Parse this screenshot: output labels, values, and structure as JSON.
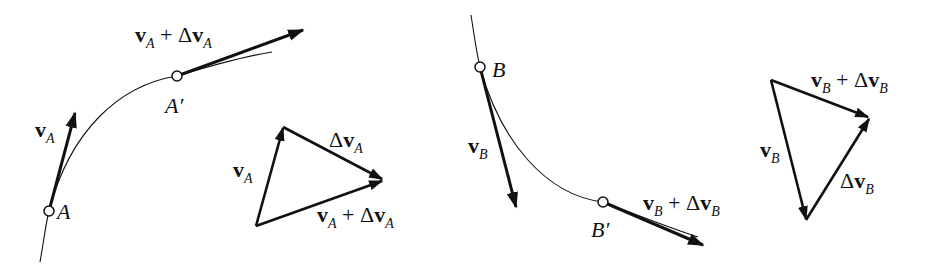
{
  "figure": {
    "colors": {
      "ink": "#111111",
      "background": "#ffffff"
    },
    "panel_a": {
      "path_points": {
        "start": "A",
        "end": "A'"
      },
      "point_labels": {
        "A": "A",
        "A_prime": "A′"
      },
      "vectors": {
        "v": {
          "bold": "v",
          "sub": "A"
        },
        "v_plus_dv": {
          "bold1": "v",
          "sub1": "A",
          "op": " + Δ",
          "bold2": "v",
          "sub2": "A"
        }
      },
      "triangle": {
        "side_v": {
          "bold": "v",
          "sub": "A"
        },
        "side_dv": {
          "delta": "Δ",
          "bold": "v",
          "sub": "A"
        },
        "side_sum": {
          "bold1": "v",
          "sub1": "A",
          "op": " + Δ",
          "bold2": "v",
          "sub2": "A"
        }
      }
    },
    "panel_b": {
      "point_labels": {
        "B": "B",
        "B_prime": "B′"
      },
      "vectors": {
        "v": {
          "bold": "v",
          "sub": "B"
        },
        "v_plus_dv": {
          "bold1": "v",
          "sub1": "B",
          "op": " + Δ",
          "bold2": "v",
          "sub2": "B"
        }
      },
      "triangle": {
        "side_v": {
          "bold": "v",
          "sub": "B"
        },
        "side_dv": {
          "delta": "Δ",
          "bold": "v",
          "sub": "B"
        },
        "side_sum": {
          "bold1": "v",
          "sub1": "B",
          "op": " + Δ",
          "bold2": "v",
          "sub2": "B"
        }
      }
    }
  }
}
